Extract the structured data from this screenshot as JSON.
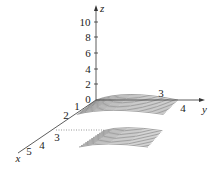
{
  "chart_data": {
    "type": "surface3d",
    "title": "",
    "axes": {
      "x": {
        "label": "x",
        "ticks": [
          "1",
          "2",
          "3",
          "4",
          "5"
        ]
      },
      "y": {
        "label": "y",
        "ticks": [
          "3",
          "4"
        ]
      },
      "z": {
        "label": "z",
        "ticks": [
          "0",
          "2",
          "4",
          "6",
          "8",
          "10"
        ],
        "range": [
          0,
          11
        ]
      }
    },
    "grid": false,
    "legend": null
  },
  "colors": {
    "axis": "#333333",
    "surface_lines": "#444444",
    "background": "#ffffff"
  }
}
